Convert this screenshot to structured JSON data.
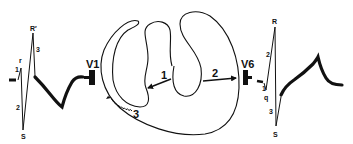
{
  "diagram": {
    "title": "",
    "colors": {
      "ink": "#111111",
      "background": "#ffffff"
    },
    "left_ecg": {
      "lead_label": "V1",
      "peak_labels": {
        "small_r": "r",
        "big_r": "R′",
        "s": "S"
      },
      "segment_labels": [
        "1",
        "2",
        "3"
      ]
    },
    "right_ecg": {
      "lead_label": "V6",
      "peak_labels": {
        "q": "q",
        "r": "R",
        "s": "S"
      },
      "segment_labels": [
        "1",
        "2",
        "3"
      ]
    },
    "heart": {
      "vectors": [
        {
          "id": "1",
          "label": "1",
          "description": "septal depolarization arrow pointing left"
        },
        {
          "id": "2",
          "label": "2",
          "description": "arrow pointing toward V6"
        },
        {
          "id": "3",
          "label": "3",
          "description": "delayed right ventricular activation (wavy arrow)"
        }
      ]
    }
  }
}
